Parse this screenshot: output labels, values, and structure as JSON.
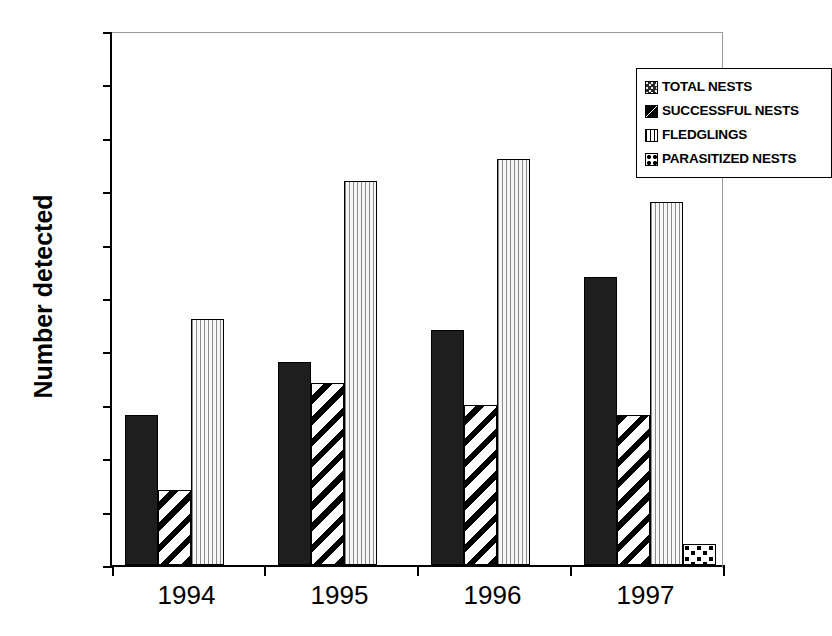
{
  "chart_data": {
    "type": "bar",
    "title": "",
    "xlabel": "",
    "ylabel": "Number detected",
    "ylim": [
      0,
      50
    ],
    "yticks": [
      0,
      5,
      10,
      15,
      20,
      25,
      30,
      35,
      40,
      45,
      50
    ],
    "ytick_labels": [
      "0",
      "5",
      "10",
      "15",
      "20",
      "25",
      "30",
      "35",
      "40",
      "45",
      "50"
    ],
    "grid": false,
    "legend_position": "top-right inside plot",
    "categories": [
      "1994",
      "1995",
      "1996",
      "1997"
    ],
    "series": [
      {
        "name": "TOTAL NESTS",
        "pattern": "speckled-dark",
        "values": [
          14,
          19,
          22,
          27
        ]
      },
      {
        "name": "SUCCESSFUL NESTS",
        "pattern": "diagonal-hatch",
        "values": [
          7,
          17,
          15,
          14
        ]
      },
      {
        "name": "FLEDGLINGS",
        "pattern": "vertical-lines",
        "values": [
          23,
          36,
          38,
          34
        ]
      },
      {
        "name": "PARASITIZED NESTS",
        "pattern": "dotted",
        "values": [
          0,
          0,
          0,
          2
        ]
      }
    ]
  },
  "legend": {
    "items": [
      {
        "label": "TOTAL NESTS"
      },
      {
        "label": "SUCCESSFUL NESTS"
      },
      {
        "label": "FLEDGLINGS"
      },
      {
        "label": "PARASITIZED NESTS"
      }
    ]
  }
}
